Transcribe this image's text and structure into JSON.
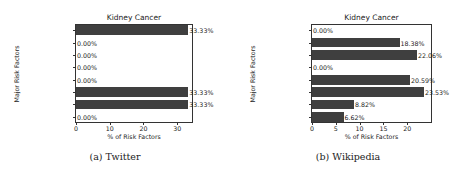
{
  "chart_data": [
    {
      "type": "bar",
      "orientation": "horizontal",
      "title": "Kidney Cancer",
      "caption": "(a) Twitter",
      "xlabel": "% of Risk Factors",
      "ylabel": "Major Risk Factors",
      "categories": [
        "Tobacco",
        "Radiations",
        "Lifestyle",
        "Chemicals",
        "Micro-organisms",
        "Genetic",
        "Physical",
        "Alcohol"
      ],
      "values": [
        33.33,
        0.0,
        0.0,
        0.0,
        0.0,
        33.33,
        33.33,
        0.0
      ],
      "value_labels": [
        "33.33%",
        "0.00%",
        "0.00%",
        "0.00%",
        "0.00%",
        "33.33%",
        "33.33%",
        "0.00%"
      ],
      "xticks": [
        0,
        10,
        20,
        30
      ],
      "xtick_labels": [
        "0",
        "10",
        "20",
        "30"
      ],
      "xlim": [
        0,
        35
      ],
      "grid": false,
      "bar_color": "#3f3f3f"
    },
    {
      "type": "bar",
      "orientation": "horizontal",
      "title": "Kidney Cancer",
      "caption": "(b) Wikipedia",
      "xlabel": "% of Risk Factors",
      "ylabel": "Major Risk Factors",
      "categories": [
        "Tobacco",
        "Radiations",
        "Lifestyle",
        "Chemicals",
        "Micro-organisms",
        "Genetic",
        "Physical",
        "Alcohol"
      ],
      "values": [
        0.0,
        18.38,
        22.06,
        0.0,
        20.59,
        23.53,
        8.82,
        6.62
      ],
      "value_labels": [
        "0.00%",
        "18.38%",
        "22.06%",
        "0.00%",
        "20.59%",
        "23.53%",
        "8.82%",
        "6.62%"
      ],
      "xticks": [
        0,
        5,
        10,
        15,
        20
      ],
      "xtick_labels": [
        "0",
        "5",
        "10",
        "15",
        "20"
      ],
      "xlim": [
        0,
        25.4
      ],
      "grid": false,
      "bar_color": "#3f3f3f"
    }
  ]
}
